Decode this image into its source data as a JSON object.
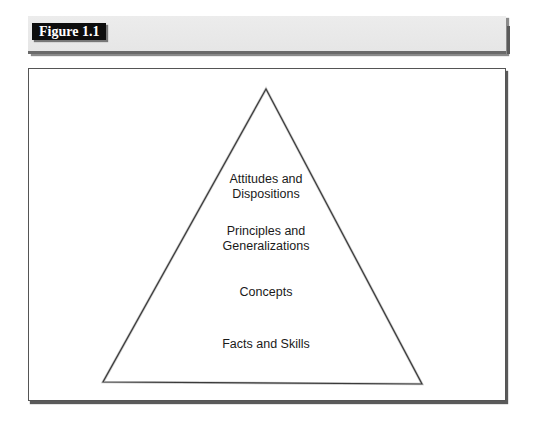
{
  "header": {
    "figure_label": "Figure 1.1",
    "bar_color": "#e8e8e8",
    "label_bg": "#0d0d0d",
    "label_text_color": "#ffffff"
  },
  "diagram": {
    "type": "pyramid",
    "apex": [
      266,
      89
    ],
    "base_left": [
      103,
      382
    ],
    "base_right": [
      422,
      384
    ],
    "levels": [
      {
        "position": "top",
        "line1": "Attitudes and",
        "line2": "Dispositions"
      },
      {
        "position": "upper-middle",
        "line1": "Principles and",
        "line2": "Generalizations"
      },
      {
        "position": "lower-middle",
        "line1": "Concepts",
        "line2": ""
      },
      {
        "position": "base",
        "line1": "Facts and Skills",
        "line2": ""
      }
    ]
  }
}
